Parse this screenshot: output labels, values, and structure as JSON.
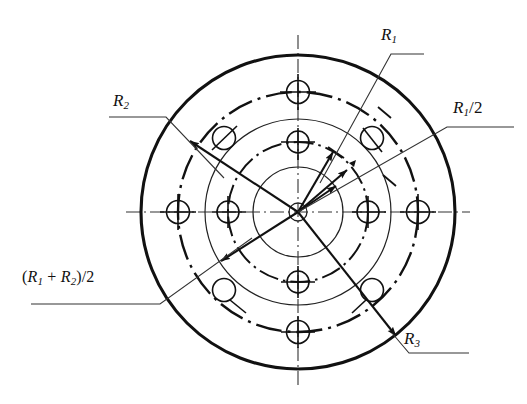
{
  "figure": {
    "type": "engineering-drawing",
    "center": {
      "x": 298,
      "y": 212
    },
    "colors": {
      "line": "#111111",
      "background": "#ffffff",
      "leader": "#333333"
    },
    "circles": [
      {
        "name": "outer-rim-circle",
        "radius": 157,
        "style": "solid-heavy"
      },
      {
        "name": "bolt-pitch-circle-outer",
        "radius": 120,
        "style": "dash-dot"
      },
      {
        "name": "mid-circle",
        "radius": 93,
        "style": "solid-thin"
      },
      {
        "name": "bolt-pitch-circle-inner",
        "radius": 70,
        "style": "dash-dot"
      },
      {
        "name": "hub-circle",
        "radius": 45,
        "style": "solid-thin"
      },
      {
        "name": "bore-circle",
        "radius": 9,
        "style": "solid-thin"
      }
    ],
    "centerlines": [
      {
        "name": "horizontal-centerline",
        "orientation": "horizontal"
      },
      {
        "name": "vertical-centerline",
        "orientation": "vertical"
      }
    ]
  },
  "labels": {
    "r1": {
      "base": "R",
      "sub": "1",
      "suffix": ""
    },
    "r2": {
      "base": "R",
      "sub": "2",
      "suffix": ""
    },
    "r1_half": {
      "base": "R",
      "sub": "1",
      "suffix": "/2"
    },
    "r3": {
      "base": "R",
      "sub": "3",
      "suffix": ""
    },
    "r_sum_half": {
      "open": "(",
      "base1": "R",
      "sub1": "1",
      "plus": " + ",
      "base2": "R",
      "sub2": "2",
      "close": ")/2"
    }
  },
  "dimension_arrows": [
    {
      "name": "arrow-r1",
      "from": "center",
      "angle_deg": 62,
      "length": 72,
      "label": "R1"
    },
    {
      "name": "arrow-r1-half",
      "from": "center",
      "angle_deg": 50,
      "length": 46,
      "label": "R1/2"
    },
    {
      "name": "arrow-r2",
      "from": "center",
      "angle_deg": 36,
      "length": 30,
      "label": "R2"
    },
    {
      "name": "arrow-to-upper-left",
      "from": "center",
      "angle_deg": 208,
      "length": 140,
      "label": "R2"
    },
    {
      "name": "arrow-to-lower-left",
      "from": "center",
      "angle_deg": 212,
      "length": 85,
      "label": "(R1+R2)/2"
    },
    {
      "name": "arrow-to-lower-right",
      "from": "center",
      "angle_deg": -52,
      "length": 155,
      "label": "R3"
    }
  ],
  "bolt_holes": [
    {
      "name": "hole-top-outer",
      "angle_deg": 90,
      "radius": 120,
      "tick": "cross"
    },
    {
      "name": "hole-top-inner",
      "angle_deg": 90,
      "radius": 70,
      "tick": "cross"
    },
    {
      "name": "hole-bottom-inner",
      "angle_deg": 270,
      "radius": 70,
      "tick": "cross"
    },
    {
      "name": "hole-bottom-outer",
      "angle_deg": 270,
      "radius": 120,
      "tick": "cross"
    },
    {
      "name": "hole-left-outer",
      "angle_deg": 180,
      "radius": 120,
      "tick": "cross"
    },
    {
      "name": "hole-left-inner",
      "angle_deg": 180,
      "radius": 70,
      "tick": "cross"
    },
    {
      "name": "hole-right-inner",
      "angle_deg": 0,
      "radius": 70,
      "tick": "cross"
    },
    {
      "name": "hole-right-outer",
      "angle_deg": 0,
      "radius": 120,
      "tick": "cross"
    },
    {
      "name": "hole-upper-left",
      "angle_deg": 135,
      "radius": 105,
      "tick": "slash"
    },
    {
      "name": "hole-upper-right",
      "angle_deg": 45,
      "radius": 105,
      "tick": "slash"
    },
    {
      "name": "hole-lower-left",
      "angle_deg": 225,
      "radius": 105,
      "tick": "slash"
    },
    {
      "name": "hole-lower-right",
      "angle_deg": 315,
      "radius": 105,
      "tick": "slash"
    }
  ]
}
